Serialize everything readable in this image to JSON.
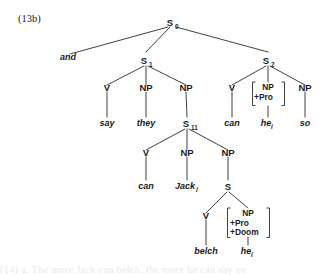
{
  "figure": {
    "example_number": "(13b)",
    "type": "syntactic-phrase-structure-tree",
    "caption_ghost": "(14) a.      The more Jack can belch, the more he can say so"
  },
  "colors": {
    "ink": "#1b1b1b",
    "line": "#2b2b2b",
    "background": "#ffffff"
  },
  "nodes": {
    "s0": {
      "label": "S",
      "subscript": "0"
    },
    "and": {
      "label": "and"
    },
    "s1": {
      "label": "S",
      "subscript": "1"
    },
    "s2": {
      "label": "S",
      "subscript": "2"
    },
    "s1_v": {
      "label": "V"
    },
    "s1_np1": {
      "label": "NP"
    },
    "s1_np2": {
      "label": "NP"
    },
    "s2_v": {
      "label": "V"
    },
    "s2_np_matrix": {
      "label": "NP"
    },
    "s2_np2": {
      "label": "NP"
    },
    "say": {
      "label": "say"
    },
    "they": {
      "label": "they"
    },
    "s11": {
      "label": "S",
      "subscript": "11"
    },
    "can_right": {
      "label": "can"
    },
    "he_right": {
      "label": "he",
      "subscript": "i"
    },
    "so": {
      "label": "so"
    },
    "s11_v": {
      "label": "V"
    },
    "s11_np1": {
      "label": "NP"
    },
    "s11_np2": {
      "label": "NP"
    },
    "can_mid": {
      "label": "can"
    },
    "jack": {
      "label": "Jack",
      "subscript": "i"
    },
    "s_low": {
      "label": "S"
    },
    "s_low_v": {
      "label": "V"
    },
    "s_low_np_matrix": {
      "label": "NP"
    },
    "belch": {
      "label": "belch"
    },
    "he_low": {
      "label": "he",
      "subscript": "i"
    }
  },
  "feature_matrices": {
    "s2_np": {
      "features": [
        "NP",
        "+Pro"
      ]
    },
    "s_low_np": {
      "features": [
        "NP",
        "+Pro",
        "+Doom"
      ]
    }
  },
  "tree_structure": {
    "root": "S0",
    "description": "S0 -> and, S1, S2; S1 -> V(say) NP(they) NP(S11); S11 -> V(can) NP(Jack_i) NP(S); S -> V(belch) NP[+Pro,+Doom](he_i); S2 -> V(can) NP[+Pro](he_i) NP(so)"
  }
}
